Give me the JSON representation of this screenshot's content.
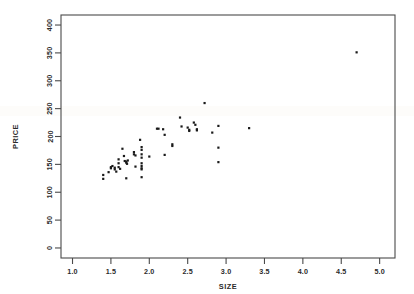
{
  "chart_data": {
    "type": "scatter",
    "title": "",
    "subtitle": "",
    "xlabel": "SIZE",
    "ylabel": "PRICE",
    "xlim": [
      0.85,
      5.2
    ],
    "ylim": [
      -18,
      418
    ],
    "grid": false,
    "legend": null,
    "legend_position": "none",
    "xticks": [
      1.0,
      1.5,
      2.0,
      2.5,
      3.0,
      3.5,
      4.0,
      4.5,
      5.0
    ],
    "xtick_labels": [
      "1.0",
      "1.5",
      "2.0",
      "2.5",
      "3.0",
      "3.5",
      "4.0",
      "4.5",
      "5.0"
    ],
    "yticks": [
      0,
      50,
      100,
      150,
      200,
      250,
      300,
      350,
      400
    ],
    "ytick_labels": [
      "0",
      "50",
      "100",
      "150",
      "200",
      "250",
      "300",
      "350",
      "400"
    ],
    "marker": "square",
    "marker_color": "#1a1a1a",
    "marker_size_px": 2.2,
    "n_points": 64,
    "annotations": [],
    "points": [
      {
        "x": 1.4,
        "y": 131
      },
      {
        "x": 1.4,
        "y": 124
      },
      {
        "x": 1.47,
        "y": 136
      },
      {
        "x": 1.5,
        "y": 145
      },
      {
        "x": 1.5,
        "y": 143
      },
      {
        "x": 1.52,
        "y": 147
      },
      {
        "x": 1.55,
        "y": 144
      },
      {
        "x": 1.55,
        "y": 141
      },
      {
        "x": 1.57,
        "y": 137
      },
      {
        "x": 1.6,
        "y": 159
      },
      {
        "x": 1.6,
        "y": 152
      },
      {
        "x": 1.6,
        "y": 145
      },
      {
        "x": 1.62,
        "y": 142
      },
      {
        "x": 1.65,
        "y": 178
      },
      {
        "x": 1.67,
        "y": 165
      },
      {
        "x": 1.68,
        "y": 156
      },
      {
        "x": 1.7,
        "y": 155
      },
      {
        "x": 1.7,
        "y": 153
      },
      {
        "x": 1.71,
        "y": 151
      },
      {
        "x": 1.72,
        "y": 157
      },
      {
        "x": 1.7,
        "y": 125
      },
      {
        "x": 1.8,
        "y": 172
      },
      {
        "x": 1.8,
        "y": 168
      },
      {
        "x": 1.82,
        "y": 166
      },
      {
        "x": 1.82,
        "y": 146
      },
      {
        "x": 1.88,
        "y": 194
      },
      {
        "x": 1.9,
        "y": 181
      },
      {
        "x": 1.9,
        "y": 176
      },
      {
        "x": 1.9,
        "y": 168
      },
      {
        "x": 1.9,
        "y": 162
      },
      {
        "x": 1.9,
        "y": 152
      },
      {
        "x": 1.9,
        "y": 147
      },
      {
        "x": 1.9,
        "y": 143
      },
      {
        "x": 1.9,
        "y": 141
      },
      {
        "x": 1.9,
        "y": 127
      },
      {
        "x": 2.0,
        "y": 164
      },
      {
        "x": 2.1,
        "y": 214
      },
      {
        "x": 2.12,
        "y": 214
      },
      {
        "x": 2.18,
        "y": 213
      },
      {
        "x": 2.2,
        "y": 203
      },
      {
        "x": 2.2,
        "y": 167
      },
      {
        "x": 2.3,
        "y": 186
      },
      {
        "x": 2.3,
        "y": 183
      },
      {
        "x": 2.4,
        "y": 234
      },
      {
        "x": 2.42,
        "y": 218
      },
      {
        "x": 2.5,
        "y": 216
      },
      {
        "x": 2.52,
        "y": 212
      },
      {
        "x": 2.52,
        "y": 210
      },
      {
        "x": 2.58,
        "y": 225
      },
      {
        "x": 2.6,
        "y": 221
      },
      {
        "x": 2.62,
        "y": 213
      },
      {
        "x": 2.62,
        "y": 211
      },
      {
        "x": 2.72,
        "y": 260
      },
      {
        "x": 2.82,
        "y": 207
      },
      {
        "x": 2.9,
        "y": 219
      },
      {
        "x": 2.9,
        "y": 180
      },
      {
        "x": 2.9,
        "y": 154
      },
      {
        "x": 3.3,
        "y": 215
      },
      {
        "x": 4.7,
        "y": 351
      }
    ]
  }
}
